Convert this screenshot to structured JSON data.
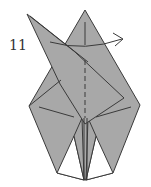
{
  "diagram": {
    "step_number": "11",
    "instruction_arrow": "fold flap to the right",
    "colors": {
      "paper": "#a8a8a8",
      "paper_white": "#ffffff",
      "line": "#3a3a3a",
      "background": "#ffffff"
    }
  }
}
